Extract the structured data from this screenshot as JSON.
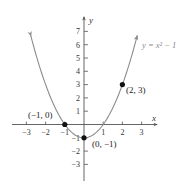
{
  "chart_data": {
    "type": "line",
    "title": "",
    "xlabel": "x",
    "ylabel": "y",
    "xlim": [
      -3.3,
      3.7
    ],
    "ylim": [
      -4.2,
      7.8
    ],
    "grid": false,
    "x_ticks": [
      -3,
      -2,
      -1,
      1,
      2,
      3
    ],
    "x_tick_labels": [
      "−3",
      "−2",
      "−1",
      "1",
      "2",
      "3"
    ],
    "y_ticks": [
      -3,
      -2,
      -1,
      1,
      2,
      3,
      4,
      5,
      6,
      7
    ],
    "y_tick_labels": [
      "−3",
      "−2",
      "−1",
      "1",
      "2",
      "3",
      "4",
      "5",
      "6",
      "7"
    ],
    "series": [
      {
        "name": "y = x² − 1",
        "function": "x^2 - 1",
        "x_range": [
          -2.77,
          2.77
        ],
        "color": "#8c8c8c"
      }
    ],
    "points": [
      {
        "x": -1,
        "y": 0,
        "label": "(−1, 0)"
      },
      {
        "x": 0,
        "y": -1,
        "label": "(0, −1)"
      },
      {
        "x": 2,
        "y": 3,
        "label": "(2, 3)"
      }
    ],
    "annotations": [
      {
        "text": "y = x² − 1",
        "position": "upper-right"
      }
    ]
  },
  "labels": {
    "x_axis": "x",
    "y_axis": "y",
    "equation": "y = x² − 1",
    "pt_neg1_0": "(−1, 0)",
    "pt_0_neg1": "(0, −1)",
    "pt_2_3": "(2, 3)",
    "xt_m3": "−3",
    "xt_m2": "−2",
    "xt_m1": "−1",
    "xt_1": "1",
    "xt_2": "2",
    "xt_3": "3",
    "yt_7": "7",
    "yt_6": "6",
    "yt_5": "5",
    "yt_4": "4",
    "yt_3": "3",
    "yt_2": "2",
    "yt_1": "1",
    "yt_m1": "−1",
    "yt_m2": "−2",
    "yt_m3": "−3"
  },
  "colors": {
    "axis": "#555555",
    "curve": "#8c8c8c",
    "point": "#111111"
  }
}
